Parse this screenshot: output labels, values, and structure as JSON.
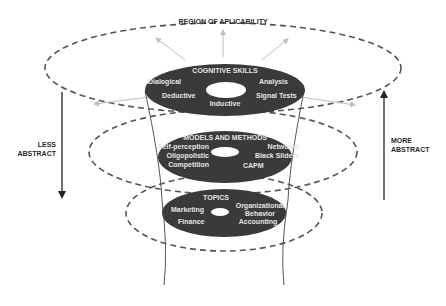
{
  "diagram": {
    "title": "REGION OF APLICABILITY",
    "left_axis": {
      "label_line1": "LESS",
      "label_line2": "ABSTRACT",
      "direction": "down"
    },
    "right_axis": {
      "label_line1": "MORE",
      "label_line2": "ABSTRACT",
      "direction": "up"
    },
    "levels": [
      {
        "title": "COGNITIVE SKILLS",
        "items_left": [
          "Dialogical",
          "Deductive"
        ],
        "items_right": [
          "Analysis",
          "Signal Tests"
        ],
        "items_bottom": [
          "Inductive"
        ]
      },
      {
        "title": "MODELS AND METHODS",
        "items_left": [
          "Self-perception",
          "Oligopolistic",
          "Competition"
        ],
        "items_right": [
          "Networks",
          "Black Sliders",
          "CAPM"
        ]
      },
      {
        "title": "TOPICS",
        "items_left": [
          "Marketing",
          "Finance"
        ],
        "items_right": [
          "Organizational",
          "Behavior",
          "Accounting"
        ]
      }
    ],
    "colors": {
      "disc_fill": "#3a3a3a",
      "disc_text": "#e4e4e4",
      "dashed_line": "#555555",
      "arrow_light": "#bdbdbd",
      "axis_arrow": "#333333"
    }
  }
}
